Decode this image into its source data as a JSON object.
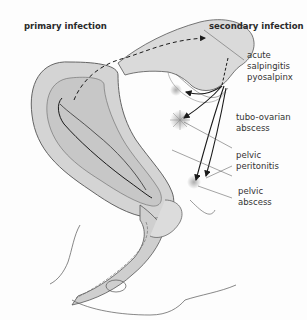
{
  "headings": {
    "primary": "primary infection",
    "secondary": "secondary infection"
  },
  "labels": [
    {
      "id": "salpingitis",
      "lines": [
        "acute",
        "salpingitis",
        "pyosalpinx"
      ]
    },
    {
      "id": "tubo-ovarian",
      "lines": [
        "tubo-ovarian",
        "abscess"
      ]
    },
    {
      "id": "peritonitis",
      "lines": [
        "pelvic",
        "peritonitis"
      ]
    },
    {
      "id": "pelvic-abscess",
      "lines": [
        "pelvic",
        "abscess"
      ]
    }
  ],
  "colors": {
    "tissue": "#d4d4d4",
    "tissue_dark": "#bdbdbd",
    "outline": "#555555",
    "arrow": "#1a1a1a",
    "leader": "#666666",
    "background": "#fdfdfd"
  }
}
